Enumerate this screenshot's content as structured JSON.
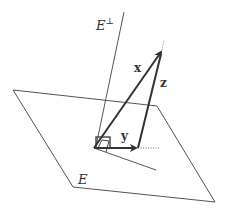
{
  "diagram": {
    "labels": {
      "orthogonal_complement": "E",
      "orthogonal_complement_sup": "⊥",
      "vector_x": "x",
      "vector_y": "y",
      "vector_z": "z",
      "plane": "E"
    },
    "colors": {
      "line": "#444444",
      "vector": "#333333",
      "background": "#ffffff"
    }
  }
}
